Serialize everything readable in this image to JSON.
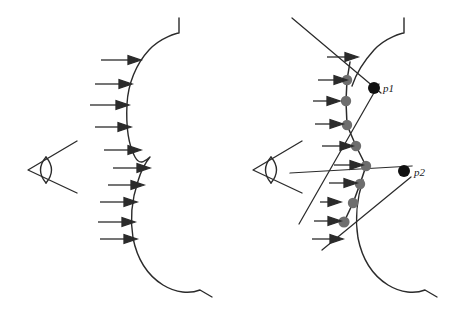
{
  "figure": {
    "title": "",
    "background_color": "#ffffff",
    "stroke_color": "#2b2b2b",
    "sample_dot_color": "#6e6e6e",
    "silhouette_dot_color": "#111111",
    "panels": [
      {
        "id": "left",
        "name": "smooth-surface-panel",
        "description": "eye viewing a smooth curved surface lit by parallel rays",
        "eye_icon": "eye-icon",
        "ray_count": 10,
        "surface_type": "smooth-curve"
      },
      {
        "id": "right",
        "name": "discretized-surface-panel",
        "description": "eye viewing a polyline approximation of the surface with sample points",
        "eye_icon": "eye-icon",
        "ray_count": 10,
        "surface_type": "polyline",
        "sample_point_count": 8,
        "silhouette_point_count": 2
      }
    ],
    "labels": [
      {
        "id": "p1",
        "text": "p1",
        "x": 381,
        "y": 88
      },
      {
        "id": "p2",
        "text": "p2",
        "x": 412,
        "y": 172
      }
    ],
    "left_rays_y": [
      60,
      84,
      105,
      127,
      150,
      168,
      185,
      202,
      222,
      239
    ],
    "right_rays_y": [
      57,
      80,
      101,
      124,
      146,
      165,
      183,
      202,
      221,
      239
    ],
    "sample_points": [
      {
        "x": 347,
        "y": 80
      },
      {
        "x": 346,
        "y": 101
      },
      {
        "x": 347,
        "y": 125
      },
      {
        "x": 356,
        "y": 146
      },
      {
        "x": 366,
        "y": 166
      },
      {
        "x": 360,
        "y": 184
      },
      {
        "x": 353,
        "y": 203
      },
      {
        "x": 344,
        "y": 222
      }
    ],
    "silhouette_points": [
      {
        "x": 374,
        "y": 88
      },
      {
        "x": 404,
        "y": 171
      }
    ]
  }
}
